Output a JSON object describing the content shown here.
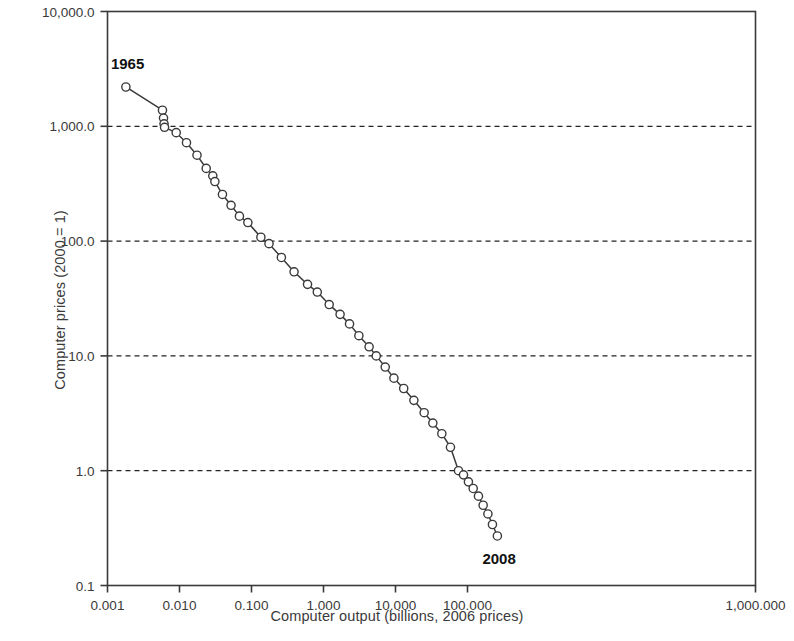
{
  "chart_data": {
    "type": "line",
    "title": "",
    "subtitle": "",
    "xlabel": "Computer output (billions, 2006 prices)",
    "ylabel": "Computer prices (2000 = 1)",
    "xscale": "log",
    "yscale": "log",
    "xlim": [
      0.001,
      1000000
    ],
    "ylim": [
      0.1,
      10000
    ],
    "grid": "horizontal-dashed",
    "legend": null,
    "xticks": [
      0.001,
      0.01,
      0.1,
      1,
      10,
      100,
      1000,
      10000,
      100000,
      1000000
    ],
    "xtick_labels": [
      "0.001",
      "0.010",
      "0.100",
      "1.000",
      "10.000",
      "100.000",
      "1,000.000"
    ],
    "xtick_values": [
      0.001,
      0.01,
      0.1,
      1,
      10,
      100,
      1000000
    ],
    "xtick_major": [
      0.001,
      0.01,
      0.1,
      1,
      10,
      100,
      1000000
    ],
    "ytick_labels": [
      "10,000.0",
      "1,000.0",
      "100.0",
      "10.0",
      "1.0",
      "0.1"
    ],
    "ytick_values": [
      10000,
      1000,
      100,
      10,
      1,
      0.1
    ],
    "gridline_values": [
      1000,
      100,
      10,
      1
    ],
    "marker": "open-circle",
    "line_color": "#3a3a3a",
    "marker_edge_color": "#3a3a3a",
    "marker_face_color": "#ffffff",
    "annotations": [
      {
        "label": "1965",
        "x": 0.0018,
        "y": 2200,
        "position": "above-left"
      },
      {
        "label": "2008",
        "x": 260.0,
        "y": 0.27,
        "position": "below-right"
      }
    ],
    "series": [
      {
        "name": "Computer prices vs output",
        "points": [
          {
            "year": 1965,
            "x": 0.0018,
            "y": 2200
          },
          {
            "year": 1966,
            "x": 0.0058,
            "y": 1380
          },
          {
            "year": 1967,
            "x": 0.006,
            "y": 1180
          },
          {
            "year": 1968,
            "x": 0.0061,
            "y": 1050
          },
          {
            "year": 1969,
            "x": 0.0062,
            "y": 980
          },
          {
            "year": 1970,
            "x": 0.009,
            "y": 880
          },
          {
            "year": 1971,
            "x": 0.0125,
            "y": 720
          },
          {
            "year": 1972,
            "x": 0.0175,
            "y": 560
          },
          {
            "year": 1973,
            "x": 0.0235,
            "y": 430
          },
          {
            "year": 1974,
            "x": 0.029,
            "y": 370
          },
          {
            "year": 1975,
            "x": 0.031,
            "y": 330
          },
          {
            "year": 1976,
            "x": 0.0395,
            "y": 255
          },
          {
            "year": 1977,
            "x": 0.052,
            "y": 205
          },
          {
            "year": 1978,
            "x": 0.068,
            "y": 165
          },
          {
            "year": 1979,
            "x": 0.089,
            "y": 145
          },
          {
            "year": 1980,
            "x": 0.135,
            "y": 108
          },
          {
            "year": 1981,
            "x": 0.175,
            "y": 95
          },
          {
            "year": 1982,
            "x": 0.26,
            "y": 72
          },
          {
            "year": 1983,
            "x": 0.39,
            "y": 54
          },
          {
            "year": 1984,
            "x": 0.6,
            "y": 42
          },
          {
            "year": 1985,
            "x": 0.82,
            "y": 36
          },
          {
            "year": 1986,
            "x": 1.2,
            "y": 28
          },
          {
            "year": 1987,
            "x": 1.7,
            "y": 23
          },
          {
            "year": 1988,
            "x": 2.3,
            "y": 19
          },
          {
            "year": 1989,
            "x": 3.1,
            "y": 15
          },
          {
            "year": 1990,
            "x": 4.3,
            "y": 12
          },
          {
            "year": 1991,
            "x": 5.4,
            "y": 10
          },
          {
            "year": 1992,
            "x": 7.2,
            "y": 8.0
          },
          {
            "year": 1993,
            "x": 9.5,
            "y": 6.4
          },
          {
            "year": 1994,
            "x": 13.0,
            "y": 5.2
          },
          {
            "year": 1995,
            "x": 18.0,
            "y": 4.1
          },
          {
            "year": 1996,
            "x": 25.0,
            "y": 3.2
          },
          {
            "year": 1997,
            "x": 33.0,
            "y": 2.6
          },
          {
            "year": 1998,
            "x": 44.0,
            "y": 2.1
          },
          {
            "year": 1999,
            "x": 58.0,
            "y": 1.6
          },
          {
            "year": 2000,
            "x": 75.0,
            "y": 1.0
          },
          {
            "year": 2001,
            "x": 88.0,
            "y": 0.92
          },
          {
            "year": 2002,
            "x": 103.0,
            "y": 0.8
          },
          {
            "year": 2003,
            "x": 120.0,
            "y": 0.7
          },
          {
            "year": 2004,
            "x": 142.0,
            "y": 0.6
          },
          {
            "year": 2005,
            "x": 165.0,
            "y": 0.5
          },
          {
            "year": 2006,
            "x": 192.0,
            "y": 0.42
          },
          {
            "year": 2007,
            "x": 222.0,
            "y": 0.34
          },
          {
            "year": 2008,
            "x": 260.0,
            "y": 0.27
          }
        ]
      }
    ]
  },
  "axes": {
    "x_title": "Computer output (billions, 2006 prices)",
    "y_title": "Computer prices (2000 = 1)"
  }
}
